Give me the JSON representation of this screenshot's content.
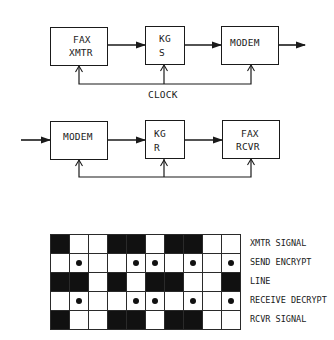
{
  "transmitter": {
    "blocks": [
      {
        "id": "fax-xmtr",
        "line1": "FAX",
        "line2": "XMTR"
      },
      {
        "id": "kg-s",
        "line1": "KG",
        "line2": "S"
      },
      {
        "id": "modem-tx",
        "line1": "MODEM",
        "line2": ""
      }
    ],
    "clock_label": "CLOCK"
  },
  "receiver": {
    "blocks": [
      {
        "id": "modem-rx",
        "line1": "MODEM",
        "line2": ""
      },
      {
        "id": "kg-r",
        "line1": "KG",
        "line2": "R"
      },
      {
        "id": "fax-rcvr",
        "line1": "FAX",
        "line2": "RCVR"
      }
    ]
  },
  "signal_table": {
    "columns": 10,
    "rows": [
      {
        "label": "XMTR SIGNAL",
        "type": "fill",
        "cells": [
          1,
          0,
          0,
          1,
          1,
          0,
          1,
          1,
          0,
          0
        ]
      },
      {
        "label": "SEND ENCRYPT",
        "type": "dot",
        "cells": [
          0,
          1,
          0,
          0,
          1,
          1,
          0,
          1,
          0,
          1
        ]
      },
      {
        "label": "LINE",
        "type": "fill",
        "cells": [
          1,
          1,
          0,
          1,
          0,
          1,
          1,
          0,
          0,
          1
        ]
      },
      {
        "label": "RECEIVE DECRYPT",
        "type": "dot",
        "cells": [
          0,
          1,
          0,
          0,
          1,
          1,
          0,
          1,
          0,
          1
        ]
      },
      {
        "label": "RCVR SIGNAL",
        "type": "fill",
        "cells": [
          1,
          0,
          0,
          1,
          1,
          0,
          1,
          1,
          0,
          0
        ]
      }
    ]
  }
}
